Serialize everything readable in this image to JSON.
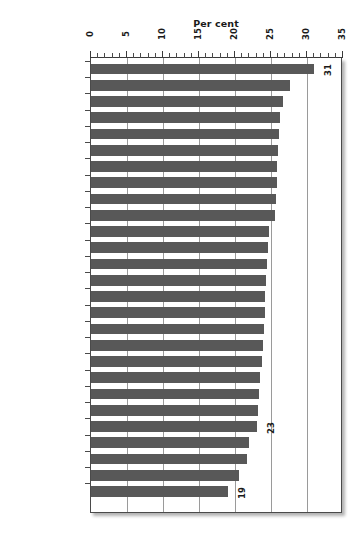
{
  "chart_data": {
    "type": "bar",
    "orientation": "horizontal",
    "title": "",
    "xlabel": "Per cent",
    "ylabel": "",
    "xlim": [
      0,
      35
    ],
    "xticks": [
      0,
      5,
      10,
      15,
      20,
      25,
      30,
      35
    ],
    "xtick_labels": [
      "0",
      "5",
      "10",
      "15",
      "20",
      "25",
      "30",
      "35"
    ],
    "minor_tick_step": 1,
    "grid": true,
    "grid_axis": "x",
    "legend": null,
    "bar_color": "#585858",
    "categories": [
      "Germany",
      "Italy",
      "Austria",
      "Slovenia",
      "The Netherlands",
      "Greece",
      "Portugal",
      "Finland",
      "Bulgaria",
      "Spain",
      "Latvia",
      "France",
      "Malta",
      "Lithuania",
      "Denmark",
      "Poland",
      "Belgium",
      "Estonia",
      "Sweden",
      "Hungary",
      "Czech Republic",
      "Romania",
      "United Kingdom",
      "Slovakia",
      "Luxembourg",
      "Cyprus",
      "Ireland"
    ],
    "values": [
      31.0,
      27.7,
      26.6,
      26.2,
      26.1,
      26.0,
      25.9,
      25.8,
      25.7,
      25.5,
      24.7,
      24.6,
      24.5,
      24.3,
      24.2,
      24.1,
      24.0,
      23.9,
      23.7,
      23.5,
      23.3,
      23.2,
      23.0,
      22.0,
      21.6,
      20.6,
      19.0
    ],
    "annotations": [
      {
        "category": "Germany",
        "label": "31"
      },
      {
        "category": "United Kingdom",
        "label": "23"
      },
      {
        "category": "Ireland",
        "label": "19"
      }
    ]
  }
}
